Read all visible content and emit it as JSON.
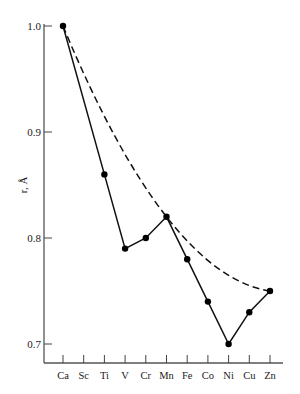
{
  "chart_data": {
    "type": "line",
    "title": "",
    "xlabel": "",
    "ylabel": "r, Å",
    "categories": [
      "Ca",
      "Sc",
      "Ti",
      "V",
      "Cr",
      "Mn",
      "Fe",
      "Co",
      "Ni",
      "Cu",
      "Zn"
    ],
    "ylim": [
      0.68,
      1.0
    ],
    "yticks": [
      0.7,
      0.8,
      0.9,
      1.0
    ],
    "ytick_labels": [
      "0.7",
      "0.8",
      "0.9",
      "1.0"
    ],
    "grid": false,
    "legend": null,
    "series": [
      {
        "name": "observed",
        "style": "solid-with-markers",
        "values": [
          1.0,
          null,
          0.86,
          0.79,
          0.8,
          0.82,
          0.78,
          0.74,
          0.7,
          0.73,
          0.75
        ]
      },
      {
        "name": "smooth curve",
        "style": "dashed",
        "points": [
          [
            "Ca",
            1.0
          ],
          [
            "Mn",
            0.82
          ],
          [
            "Zn",
            0.75
          ]
        ]
      }
    ]
  }
}
